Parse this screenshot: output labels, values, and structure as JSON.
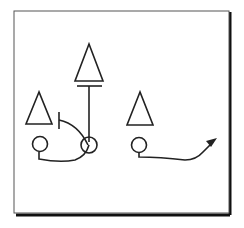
{
  "diagram": {
    "type": "football-play",
    "frame": {
      "border_color": "#555555",
      "shadow_color": "#111111",
      "background": "#ffffff"
    },
    "stroke_color": "#222222",
    "defenders": [
      {
        "id": "defender-top",
        "shape": "triangle",
        "x": 89,
        "y": 44
      },
      {
        "id": "defender-left",
        "shape": "triangle",
        "x": 39,
        "y": 92
      },
      {
        "id": "defender-right",
        "shape": "triangle",
        "x": 140,
        "y": 92
      }
    ],
    "offense": [
      {
        "id": "player-left",
        "shape": "circle",
        "x": 40,
        "y": 144
      },
      {
        "id": "player-center",
        "shape": "circle",
        "x": 89,
        "y": 145
      },
      {
        "id": "player-right",
        "shape": "circle",
        "x": 139,
        "y": 145
      }
    ],
    "routes": [
      {
        "id": "block-top",
        "kind": "block",
        "from": "player-center",
        "to": "defender-top"
      },
      {
        "id": "block-left",
        "kind": "block",
        "from": "player-center",
        "to": "defender-left"
      },
      {
        "id": "motion-left",
        "kind": "motion",
        "from": "player-left",
        "to": "player-center"
      },
      {
        "id": "route-right",
        "kind": "pass-route",
        "from": "player-right",
        "direction": "up-right",
        "arrow": true
      }
    ]
  }
}
